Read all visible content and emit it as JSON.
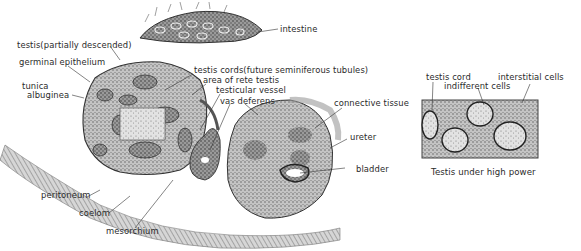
{
  "figure": {
    "main_labels": {
      "intestine": "intestine",
      "testis_partially_descended": "testis(partially descended)",
      "germinal_epithelium": "germinal epithelium",
      "tunica_line1": "tunica",
      "tunica_line2": "albuginea",
      "testis_cords": "testis cords(future seminiferous tubules)",
      "area_of_rete_testis": "area of rete testis",
      "testicular_vessel": "testicular vessel",
      "vas_deferens": "vas deferens",
      "connective_tissue": "connective tissue",
      "ureter": "ureter",
      "bladder": "bladder",
      "peritoneum": "peritoneum",
      "coelom": "coelom",
      "mesorchium": "mesorchium"
    },
    "inset": {
      "testis_cord": "testis cord",
      "indifferent_cells": "indifferent cells",
      "interstitial_cells": "interstitial cells",
      "caption": "Testis under high power"
    },
    "colors": {
      "ink": "#2a2a2a",
      "stipple_dark": "#4a4a4a",
      "stipple_mid": "#8a8a8a",
      "stipple_light": "#bdbdbd",
      "background": "#ffffff"
    }
  }
}
